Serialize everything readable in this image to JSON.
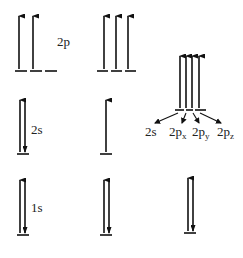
{
  "diagram": {
    "type": "orbital-energy-diagram",
    "colors": {
      "line": "#111111",
      "text": "#222222",
      "background": "#ffffff"
    },
    "columns": [
      {
        "name": "ground-state",
        "levels": [
          {
            "label": "2p",
            "orbitals": 3,
            "electrons": [
              "up",
              "up",
              "none"
            ]
          },
          {
            "label": "2s",
            "orbitals": 1,
            "electrons": [
              "pair"
            ]
          },
          {
            "label": "1s",
            "orbitals": 1,
            "electrons": [
              "pair"
            ]
          }
        ]
      },
      {
        "name": "excited-state",
        "levels": [
          {
            "label": "",
            "orbitals": 3,
            "electrons": [
              "up",
              "up",
              "up"
            ]
          },
          {
            "label": "",
            "orbitals": 1,
            "electrons": [
              "up"
            ]
          },
          {
            "label": "",
            "orbitals": 1,
            "electrons": [
              "pair"
            ]
          }
        ]
      },
      {
        "name": "hybridized-state",
        "levels": [
          {
            "label": "",
            "orbitals": 4,
            "electrons": [
              "up",
              "up",
              "up",
              "up"
            ],
            "orbital_labels": [
              "2s",
              "2p",
              "2p",
              "2p"
            ],
            "orbital_subscripts": [
              "",
              "x",
              "y",
              "z"
            ]
          },
          {
            "label": "",
            "orbitals": 1,
            "electrons": [
              "pair"
            ]
          }
        ]
      }
    ],
    "labels": {
      "col1_2p": "2p",
      "col1_2s": "2s",
      "col1_1s": "1s",
      "hyb_2s": "2s",
      "hyb_2p": "2p",
      "sub_x": "x",
      "sub_y": "y",
      "sub_z": "z"
    }
  }
}
